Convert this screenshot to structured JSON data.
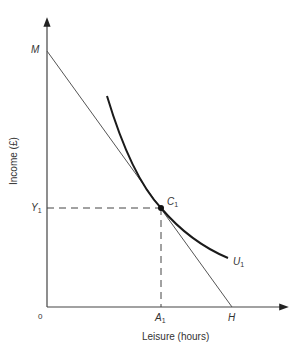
{
  "diagram": {
    "type": "indifference-curve-budget-line",
    "y_axis_label": "Income (£)",
    "x_axis_label": "Leisure (hours)",
    "origin_label": "0",
    "points": {
      "M": {
        "label": "M"
      },
      "H": {
        "label": "H"
      },
      "C1": {
        "label": "C",
        "sub": "1"
      },
      "Y1": {
        "label": "Y",
        "sub": "1"
      },
      "A1": {
        "label": "A",
        "sub": "1"
      },
      "U1": {
        "label": "U",
        "sub": "1"
      }
    },
    "colors": {
      "line": "#333333",
      "curve": "#1a1a1a",
      "text": "#333333"
    }
  }
}
